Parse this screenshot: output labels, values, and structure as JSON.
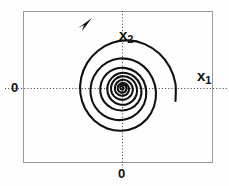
{
  "figure": {
    "title": "",
    "background_color": "#fefefe",
    "width": 229,
    "height": 186
  },
  "labels": {
    "x_axis_variable": "x",
    "x_axis_subscript": "1",
    "y_axis_variable": "x",
    "y_axis_subscript": "2",
    "origin_vertical": "0",
    "origin_horizontal": "0"
  },
  "colors": {
    "curve": "#111111",
    "frame": "#9a9a9a",
    "axis_dotted": "#3a3a3a",
    "text": "#101010"
  },
  "chart_data": {
    "type": "line",
    "title": "",
    "xlabel": "x1",
    "ylabel": "x2",
    "grid": false,
    "legend": null,
    "annotations": [
      {
        "name": "direction-arrow",
        "text": "",
        "x": 88,
        "y": 22,
        "description": "arrowhead on spiral indicating outward counterclockwise-to-outward flow direction"
      },
      {
        "name": "origin-x-tick",
        "text": "0",
        "x": 122,
        "y": 172
      },
      {
        "name": "origin-y-tick",
        "text": "0",
        "x": 15,
        "y": 88
      }
    ],
    "axes": {
      "x_dotted_line_y": 88,
      "y_dotted_line_x": 122,
      "frame_left": 23,
      "frame_top": 11,
      "frame_right": 213,
      "frame_bottom": 163
    },
    "series": [
      {
        "name": "unstable-focus-trajectory",
        "kind": "logarithmic-spiral",
        "center": [
          122,
          88
        ],
        "direction": "counterclockwise outward",
        "growth_rate": 0.135,
        "theta_start_deg": -70,
        "theta_end_deg": 880,
        "r_start": 1.2,
        "points": [
          [
            122.5,
            86.8
          ],
          [
            123.4,
            87.6
          ],
          [
            123.2,
            89.2
          ],
          [
            121.6,
            89.6
          ],
          [
            120.3,
            88.3
          ],
          [
            120.6,
            86.1
          ],
          [
            122.5,
            84.8
          ],
          [
            125.0,
            85.4
          ],
          [
            126.4,
            87.7
          ],
          [
            125.9,
            90.6
          ],
          [
            123.5,
            92.5
          ],
          [
            120.3,
            92.2
          ],
          [
            118.0,
            89.8
          ],
          [
            118.0,
            86.3
          ],
          [
            120.3,
            83.6
          ],
          [
            124.0,
            83.0
          ],
          [
            127.4,
            84.9
          ],
          [
            129.0,
            88.6
          ],
          [
            128.0,
            92.6
          ],
          [
            124.8,
            95.3
          ],
          [
            120.4,
            95.6
          ],
          [
            116.6,
            93.2
          ],
          [
            114.9,
            89.0
          ],
          [
            115.9,
            84.2
          ],
          [
            119.2,
            80.8
          ],
          [
            124.0,
            79.8
          ],
          [
            128.9,
            81.8
          ],
          [
            132.2,
            86.1
          ],
          [
            132.6,
            91.6
          ],
          [
            129.9,
            96.6
          ],
          [
            125.0,
            99.5
          ],
          [
            119.1,
            99.3
          ],
          [
            113.9,
            96.1
          ],
          [
            111.2,
            90.7
          ],
          [
            111.7,
            84.4
          ],
          [
            115.3,
            79.2
          ],
          [
            121.1,
            76.4
          ],
          [
            127.7,
            77.0
          ],
          [
            133.5,
            80.9
          ],
          [
            136.7,
            87.3
          ],
          [
            136.5,
            94.6
          ],
          [
            132.7,
            100.8
          ],
          [
            126.3,
            104.4
          ],
          [
            118.7,
            104.2
          ],
          [
            111.8,
            100.2
          ],
          [
            107.8,
            93.4
          ],
          [
            107.7,
            85.3
          ],
          [
            111.6,
            78.1
          ],
          [
            118.6,
            73.6
          ],
          [
            127.0,
            73.2
          ],
          [
            134.8,
            77.1
          ],
          [
            140.1,
            84.6
          ],
          [
            141.4,
            93.7
          ],
          [
            138.1,
            102.3
          ],
          [
            130.9,
            108.4
          ],
          [
            121.4,
            110.5
          ],
          [
            111.7,
            108.1
          ],
          [
            104.1,
            101.7
          ],
          [
            100.4,
            92.7
          ],
          [
            101.3,
            82.7
          ],
          [
            106.6,
            74.1
          ],
          [
            115.4,
            68.8
          ],
          [
            125.9,
            68.1
          ],
          [
            135.9,
            72.2
          ],
          [
            143.3,
            80.6
          ],
          [
            146.3,
            92.0
          ],
          [
            144.2,
            103.6
          ],
          [
            137.3,
            113.3
          ],
          [
            126.8,
            119.1
          ],
          [
            114.8,
            119.8
          ],
          [
            103.5,
            115.3
          ],
          [
            94.9,
            106.5
          ],
          [
            90.7,
            94.8
          ],
          [
            91.6,
            82.2
          ],
          [
            97.4,
            70.8
          ],
          [
            107.2,
            62.4
          ],
          [
            119.5,
            58.5
          ],
          [
            132.5,
            60.0
          ],
          [
            144.2,
            66.9
          ],
          [
            152.5,
            78.2
          ],
          [
            156.0,
            92.1
          ],
          [
            154.0,
            106.5
          ],
          [
            146.8,
            119.0
          ],
          [
            135.4,
            127.5
          ],
          [
            121.5,
            130.8
          ],
          [
            107.2,
            128.4
          ],
          [
            94.5,
            120.7
          ],
          [
            85.1,
            108.5
          ],
          [
            80.4,
            93.6
          ],
          [
            81.2,
            77.8
          ],
          [
            87.2,
            62.9
          ],
          [
            98.0,
            50.7
          ],
          [
            112.3,
            42.8
          ],
          [
            128.5,
            40.4
          ],
          [
            144.7,
            44.1
          ],
          [
            159.0,
            53.3
          ],
          [
            169.7,
            67.0
          ],
          [
            175.4,
            83.4
          ],
          [
            175.5,
            100.9
          ]
        ],
        "exit_point": [
          213,
          45
        ],
        "start_point": [
          122,
          88
        ],
        "description": "Outward-growing spiral trajectory of an unstable focus equilibrium in the x1-x2 phase plane"
      }
    ]
  }
}
